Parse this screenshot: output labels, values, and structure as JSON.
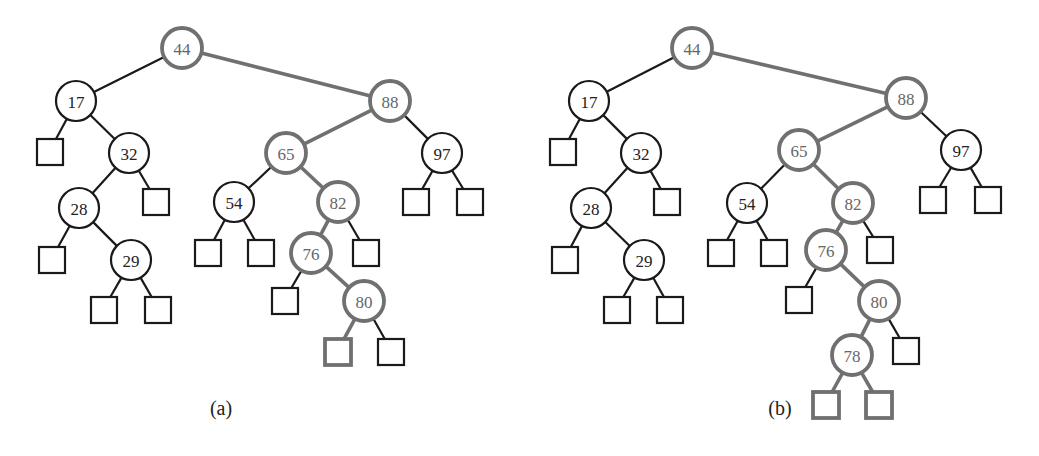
{
  "colors": {
    "normal": "#1a1a1a",
    "highlight": "#707070",
    "background": "#ffffff"
  },
  "trees": [
    {
      "id": "a",
      "caption": "(a)",
      "caption_pos": [
        221,
        415
      ],
      "nodes": [
        {
          "id": "n44",
          "label": "44",
          "x": 182,
          "y": 48,
          "hl": true
        },
        {
          "id": "n17",
          "label": "17",
          "x": 76,
          "y": 101,
          "hl": false
        },
        {
          "id": "n32",
          "label": "32",
          "x": 129,
          "y": 153,
          "hl": false
        },
        {
          "id": "n28",
          "label": "28",
          "x": 79,
          "y": 208,
          "hl": false
        },
        {
          "id": "n29",
          "label": "29",
          "x": 131,
          "y": 260,
          "hl": false
        },
        {
          "id": "n88",
          "label": "88",
          "x": 390,
          "y": 101,
          "hl": true
        },
        {
          "id": "n65",
          "label": "65",
          "x": 286,
          "y": 153,
          "hl": true
        },
        {
          "id": "n54",
          "label": "54",
          "x": 234,
          "y": 202,
          "hl": false
        },
        {
          "id": "n82",
          "label": "82",
          "x": 338,
          "y": 202,
          "hl": true
        },
        {
          "id": "n76",
          "label": "76",
          "x": 311,
          "y": 253,
          "hl": true
        },
        {
          "id": "n80",
          "label": "80",
          "x": 364,
          "y": 301,
          "hl": true
        },
        {
          "id": "n97",
          "label": "97",
          "x": 442,
          "y": 153,
          "hl": false
        }
      ],
      "leaves": [
        {
          "id": "l17L",
          "x": 50,
          "y": 152,
          "hl": false,
          "parent": "n17"
        },
        {
          "id": "l32R",
          "x": 156,
          "y": 202,
          "hl": false,
          "parent": "n32"
        },
        {
          "id": "l28L",
          "x": 52,
          "y": 260,
          "hl": false,
          "parent": "n28"
        },
        {
          "id": "l29L",
          "x": 104,
          "y": 310,
          "hl": false,
          "parent": "n29"
        },
        {
          "id": "l29R",
          "x": 158,
          "y": 310,
          "hl": false,
          "parent": "n29"
        },
        {
          "id": "l54L",
          "x": 208,
          "y": 253,
          "hl": false,
          "parent": "n54"
        },
        {
          "id": "l54R",
          "x": 261,
          "y": 253,
          "hl": false,
          "parent": "n54"
        },
        {
          "id": "l82R",
          "x": 366,
          "y": 253,
          "hl": false,
          "parent": "n82"
        },
        {
          "id": "l76L",
          "x": 285,
          "y": 301,
          "hl": false,
          "parent": "n76"
        },
        {
          "id": "l80L",
          "x": 338,
          "y": 352,
          "hl": true,
          "parent": "n80"
        },
        {
          "id": "l80R",
          "x": 391,
          "y": 352,
          "hl": false,
          "parent": "n80"
        },
        {
          "id": "l97L",
          "x": 416,
          "y": 202,
          "hl": false,
          "parent": "n97"
        },
        {
          "id": "l97R",
          "x": 470,
          "y": 202,
          "hl": false,
          "parent": "n97"
        }
      ],
      "edges": [
        [
          "n44",
          "n17",
          false
        ],
        [
          "n44",
          "n88",
          true
        ],
        [
          "n17",
          "l17L",
          false
        ],
        [
          "n17",
          "n32",
          false
        ],
        [
          "n32",
          "n28",
          false
        ],
        [
          "n32",
          "l32R",
          false
        ],
        [
          "n28",
          "l28L",
          false
        ],
        [
          "n28",
          "n29",
          false
        ],
        [
          "n29",
          "l29L",
          false
        ],
        [
          "n29",
          "l29R",
          false
        ],
        [
          "n88",
          "n65",
          true
        ],
        [
          "n88",
          "n97",
          false
        ],
        [
          "n65",
          "n54",
          false
        ],
        [
          "n65",
          "n82",
          true
        ],
        [
          "n54",
          "l54L",
          false
        ],
        [
          "n54",
          "l54R",
          false
        ],
        [
          "n82",
          "n76",
          true
        ],
        [
          "n82",
          "l82R",
          false
        ],
        [
          "n76",
          "l76L",
          false
        ],
        [
          "n76",
          "n80",
          true
        ],
        [
          "n80",
          "l80L",
          true
        ],
        [
          "n80",
          "l80R",
          false
        ],
        [
          "n97",
          "l97L",
          false
        ],
        [
          "n97",
          "l97R",
          false
        ]
      ]
    },
    {
      "id": "b",
      "caption": "(b)",
      "caption_pos": [
        780,
        415
      ],
      "nodes": [
        {
          "id": "n44",
          "label": "44",
          "x": 692,
          "y": 48,
          "hl": true
        },
        {
          "id": "n17",
          "label": "17",
          "x": 589,
          "y": 101,
          "hl": false
        },
        {
          "id": "n32",
          "label": "32",
          "x": 641,
          "y": 153,
          "hl": false
        },
        {
          "id": "n28",
          "label": "28",
          "x": 591,
          "y": 208,
          "hl": false
        },
        {
          "id": "n29",
          "label": "29",
          "x": 644,
          "y": 260,
          "hl": false
        },
        {
          "id": "n88",
          "label": "88",
          "x": 906,
          "y": 98,
          "hl": true
        },
        {
          "id": "n65",
          "label": "65",
          "x": 799,
          "y": 150,
          "hl": true
        },
        {
          "id": "n54",
          "label": "54",
          "x": 747,
          "y": 203,
          "hl": false
        },
        {
          "id": "n82",
          "label": "82",
          "x": 853,
          "y": 203,
          "hl": true
        },
        {
          "id": "n76",
          "label": "76",
          "x": 826,
          "y": 250,
          "hl": true
        },
        {
          "id": "n80",
          "label": "80",
          "x": 879,
          "y": 301,
          "hl": true
        },
        {
          "id": "n78",
          "label": "78",
          "x": 852,
          "y": 355,
          "hl": true
        },
        {
          "id": "n97",
          "label": "97",
          "x": 961,
          "y": 150,
          "hl": false
        }
      ],
      "leaves": [
        {
          "id": "l17L",
          "x": 563,
          "y": 152,
          "hl": false,
          "parent": "n17"
        },
        {
          "id": "l32R",
          "x": 667,
          "y": 202,
          "hl": false,
          "parent": "n32"
        },
        {
          "id": "l28L",
          "x": 565,
          "y": 260,
          "hl": false,
          "parent": "n28"
        },
        {
          "id": "l29L",
          "x": 617,
          "y": 310,
          "hl": false,
          "parent": "n29"
        },
        {
          "id": "l29R",
          "x": 670,
          "y": 310,
          "hl": false,
          "parent": "n29"
        },
        {
          "id": "l54L",
          "x": 721,
          "y": 253,
          "hl": false,
          "parent": "n54"
        },
        {
          "id": "l54R",
          "x": 774,
          "y": 253,
          "hl": false,
          "parent": "n54"
        },
        {
          "id": "l82R",
          "x": 880,
          "y": 250,
          "hl": false,
          "parent": "n82"
        },
        {
          "id": "l76L",
          "x": 799,
          "y": 300,
          "hl": false,
          "parent": "n76"
        },
        {
          "id": "l80R",
          "x": 906,
          "y": 351,
          "hl": false,
          "parent": "n80"
        },
        {
          "id": "l78L",
          "x": 826,
          "y": 405,
          "hl": true,
          "parent": "n78"
        },
        {
          "id": "l78R",
          "x": 879,
          "y": 405,
          "hl": true,
          "parent": "n78"
        },
        {
          "id": "l97L",
          "x": 933,
          "y": 200,
          "hl": false,
          "parent": "n97"
        },
        {
          "id": "l97R",
          "x": 988,
          "y": 200,
          "hl": false,
          "parent": "n97"
        }
      ],
      "edges": [
        [
          "n44",
          "n17",
          false
        ],
        [
          "n44",
          "n88",
          true
        ],
        [
          "n17",
          "l17L",
          false
        ],
        [
          "n17",
          "n32",
          false
        ],
        [
          "n32",
          "n28",
          false
        ],
        [
          "n32",
          "l32R",
          false
        ],
        [
          "n28",
          "l28L",
          false
        ],
        [
          "n28",
          "n29",
          false
        ],
        [
          "n29",
          "l29L",
          false
        ],
        [
          "n29",
          "l29R",
          false
        ],
        [
          "n88",
          "n65",
          true
        ],
        [
          "n88",
          "n97",
          false
        ],
        [
          "n65",
          "n54",
          false
        ],
        [
          "n65",
          "n82",
          true
        ],
        [
          "n54",
          "l54L",
          false
        ],
        [
          "n54",
          "l54R",
          false
        ],
        [
          "n82",
          "n76",
          true
        ],
        [
          "n82",
          "l82R",
          false
        ],
        [
          "n76",
          "l76L",
          false
        ],
        [
          "n76",
          "n80",
          true
        ],
        [
          "n80",
          "n78",
          true
        ],
        [
          "n80",
          "l80R",
          false
        ],
        [
          "n78",
          "l78L",
          true
        ],
        [
          "n78",
          "l78R",
          true
        ],
        [
          "n97",
          "l97L",
          false
        ],
        [
          "n97",
          "l97R",
          false
        ]
      ]
    }
  ]
}
